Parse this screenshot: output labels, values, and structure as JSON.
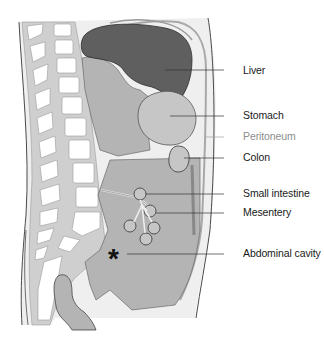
{
  "diagram": {
    "colors": {
      "body_fill": "#efefef",
      "outline": "#4a4a4a",
      "vertebra_fill": "#ffffff",
      "bone_gray": "#cfcfcf",
      "liver": "#5f5f5f",
      "organ_gray": "#b4b4b4",
      "stomach": "#c6c6c6",
      "leader_line": "#333333",
      "peritoneum_leader": "#a0a0a0"
    },
    "labels": [
      {
        "id": "liver",
        "text": "Liver",
        "y": 70,
        "muted": false
      },
      {
        "id": "stomach",
        "text": "Stomach",
        "y": 115,
        "muted": false
      },
      {
        "id": "peritoneum",
        "text": "Peritoneum",
        "y": 136,
        "muted": true
      },
      {
        "id": "colon",
        "text": "Colon",
        "y": 157,
        "muted": false
      },
      {
        "id": "small-intestine",
        "text": "Small intestine",
        "y": 193,
        "muted": false
      },
      {
        "id": "mesentery",
        "text": "Mesentery",
        "y": 212,
        "muted": false
      },
      {
        "id": "abdominal-cavity",
        "text": "Abdominal cavity",
        "y": 253,
        "muted": false
      }
    ],
    "marker_symbol": "*"
  }
}
